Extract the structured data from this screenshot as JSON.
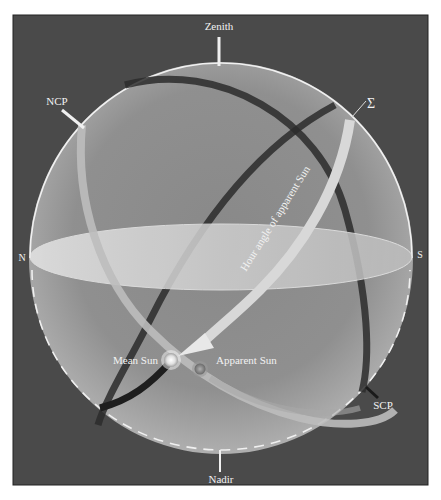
{
  "diagram": {
    "type": "celestial-sphere",
    "labels": {
      "zenith": "Zenith",
      "nadir": "Nadir",
      "ncp": "NCP",
      "scp": "SCP",
      "north": "N",
      "south": "S",
      "sigma": "Σ",
      "hour_angle": "Hour angle of apparent Sun",
      "mean_sun": "Mean Sun",
      "apparent_sun": "Apparent Sun"
    },
    "colors": {
      "background": "#4a4a4a",
      "sphere": "#9a9a9a",
      "horizon": "#d0d0d0",
      "band_light": "#c8c8c8",
      "band_dark": "#2a2a2a",
      "label": "#f2f2f2"
    }
  }
}
